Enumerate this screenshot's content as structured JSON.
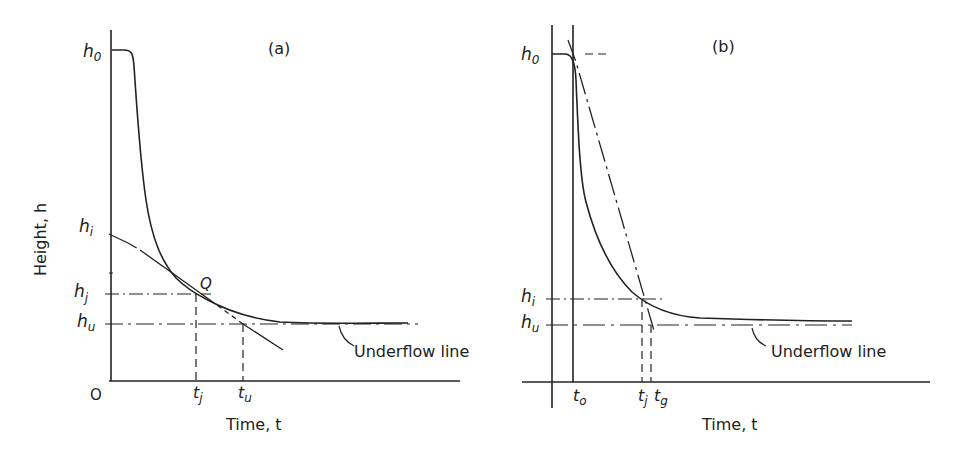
{
  "figure": {
    "panel_a": {
      "title": "(a)",
      "y_axis_label": "Height, h",
      "x_axis_label": "Time, t",
      "origin_label": "O",
      "y_ticks": {
        "h0": "h",
        "h0_sub": "0",
        "hi": "h",
        "hi_sub": "i",
        "hj": "h",
        "hj_sub": "j",
        "hu": "h",
        "hu_sub": "u"
      },
      "x_ticks": {
        "tj": "t",
        "tj_sub": "j",
        "tu": "t",
        "tu_sub": "u"
      },
      "point_label": "Q",
      "annotation": "Underflow line"
    },
    "panel_b": {
      "title": "(b)",
      "x_axis_label": "Time, t",
      "y_ticks": {
        "h0": "h",
        "h0_sub": "0",
        "hi": "h",
        "hi_sub": "i",
        "hu": "h",
        "hu_sub": "u"
      },
      "x_ticks": {
        "to": "t",
        "to_sub": "o",
        "tj": "t",
        "tj_sub": "j",
        "tg": "t",
        "tg_sub": "g"
      },
      "annotation": "Underflow line"
    }
  },
  "colors": {
    "ink": "#222222",
    "background": "#ffffff"
  }
}
